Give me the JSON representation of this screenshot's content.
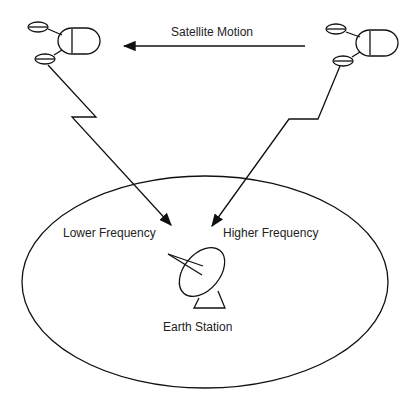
{
  "diagram": {
    "labels": {
      "motion": "Satellite Motion",
      "lower": "Lower Frequency",
      "higher": "Higher Frequency",
      "station": "Earth Station"
    },
    "colors": {
      "stroke": "#111111",
      "text": "#222222",
      "background": "#ffffff"
    }
  }
}
